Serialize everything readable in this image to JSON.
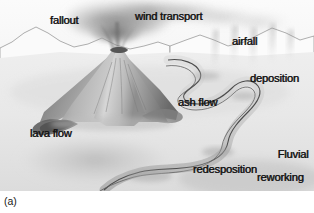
{
  "figure": {
    "caption": "(a)",
    "palette": {
      "background": "#ffffff",
      "sky": "#f2f2f2",
      "ground": "#ededed",
      "volcano_light": "#d8d8d8",
      "volcano_mid": "#a8a8a8",
      "volcano_dark": "#6e6e6e",
      "plume": "#8f8f8f",
      "river_outline": "#4a4a4a",
      "river_fill": "#d2d2d2",
      "label_text": "#141414"
    },
    "labels": [
      {
        "id": "fallout",
        "text": "fallout"
      },
      {
        "id": "wind_transport",
        "text": "wind transport"
      },
      {
        "id": "airfall",
        "text": "airfall"
      },
      {
        "id": "deposition",
        "text": "deposition"
      },
      {
        "id": "ash_flow",
        "text": "ash flow"
      },
      {
        "id": "lava_flow",
        "text": "lava flow"
      },
      {
        "id": "fluvial_line1",
        "text": "Fluvial"
      },
      {
        "id": "fluvial_line2",
        "text": "reworking"
      },
      {
        "id": "redesposition",
        "text": "redesposition"
      }
    ]
  }
}
